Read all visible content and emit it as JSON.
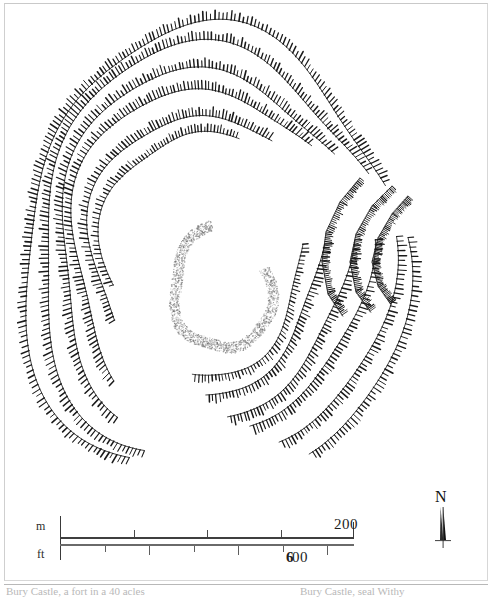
{
  "figure": {
    "kind": "archaeological-site-plan",
    "ink_color": "#1a1a1a",
    "paper_color": "#ffffff"
  },
  "scalebar": {
    "metric_unit_label": "m",
    "imperial_unit_label": "ft",
    "metric_max_label": "200",
    "imperial_max_label": "600",
    "imperial_max_leading_digit": "6",
    "imperial_max_trailing_digits": "00",
    "metric_ticks": [
      0,
      50,
      100,
      150,
      200
    ],
    "imperial_ticks": [
      0,
      100,
      200,
      300,
      400,
      500,
      600
    ],
    "metric_range": [
      0,
      200
    ],
    "imperial_range": [
      0,
      660
    ]
  },
  "north_arrow": {
    "label": "N"
  },
  "caption_fragments": {
    "left": "Bury Castle, a fort in a 40 acles",
    "right": "Bury Castle, seal Withy"
  },
  "map_geometry": {
    "description": "Concentric hachured rampart contours of an oval hillfort with inturned entrance on the east side, and a faint stippled inner enclosure ring.",
    "center": [
      205,
      255
    ],
    "hachure_ramparts": [
      {
        "name": "outer-rampart-1",
        "rx": 188,
        "ry": 228,
        "cx": 212,
        "cy": 258,
        "rotation": -6,
        "hachure_side": "outward",
        "gaps": [
          [
            18,
            34
          ],
          [
            96,
            104
          ]
        ],
        "tick_len": 7,
        "tick_step": 4.2,
        "weight": 1.5
      },
      {
        "name": "outer-rampart-2",
        "rx": 172,
        "ry": 210,
        "cx": 211,
        "cy": 256,
        "rotation": -6,
        "hachure_side": "outward",
        "gaps": [
          [
            20,
            33
          ],
          [
            95,
            106
          ]
        ],
        "tick_len": 7,
        "tick_step": 4.0,
        "weight": 1.5
      },
      {
        "name": "mid-rampart-1",
        "rx": 152,
        "ry": 186,
        "cx": 209,
        "cy": 254,
        "rotation": -5,
        "hachure_side": "outward",
        "gaps": [
          [
            22,
            36
          ],
          [
            92,
            108
          ]
        ],
        "tick_len": 7,
        "tick_step": 4.0,
        "weight": 1.5
      },
      {
        "name": "mid-rampart-2",
        "rx": 136,
        "ry": 168,
        "cx": 208,
        "cy": 253,
        "rotation": -5,
        "hachure_side": "outward",
        "gaps": [
          [
            24,
            38
          ],
          [
            90,
            110
          ]
        ],
        "tick_len": 7,
        "tick_step": 3.9,
        "weight": 1.5
      },
      {
        "name": "inner-rampart-1",
        "rx": 114,
        "ry": 142,
        "cx": 206,
        "cy": 252,
        "rotation": -4,
        "hachure_side": "outward",
        "gaps": [
          [
            26,
            42
          ],
          [
            86,
            112
          ]
        ],
        "tick_len": 7,
        "tick_step": 3.8,
        "weight": 1.5
      },
      {
        "name": "inner-rampart-2",
        "rx": 99,
        "ry": 124,
        "cx": 205,
        "cy": 251,
        "rotation": -4,
        "hachure_side": "outward",
        "gaps": [
          [
            28,
            46
          ],
          [
            82,
            116
          ]
        ],
        "tick_len": 6,
        "tick_step": 3.7,
        "weight": 1.4
      }
    ],
    "entrance": {
      "name": "east-inturned-entrance",
      "approx_position": [
        400,
        250
      ],
      "style": "inturned passage between rampart terminals"
    },
    "inner_enclosure": {
      "name": "stippled-inner-ring",
      "cx": 222,
      "cy": 288,
      "rx": 48,
      "ry": 62,
      "rotation": -6,
      "style": "stipple",
      "gap": [
        74,
        96
      ]
    }
  }
}
